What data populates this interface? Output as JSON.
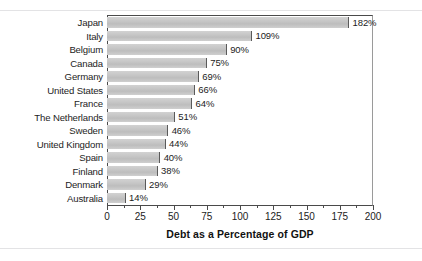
{
  "chart_data": {
    "type": "bar",
    "orientation": "horizontal",
    "title": "",
    "xlabel": "Debt as a Percentage of GDP",
    "ylabel": "",
    "xlim": [
      0,
      200
    ],
    "xticks": [
      0,
      25,
      50,
      75,
      100,
      125,
      150,
      175,
      200
    ],
    "xtick_labels": [
      "0",
      "25",
      "50",
      "75",
      "100",
      "125",
      "150",
      "175",
      "200"
    ],
    "minor_tick_step": 12.5,
    "grid": false,
    "legend": false,
    "value_label_suffix": "%",
    "bar_color": "#c6c6c6",
    "bar_end_color": "#5a5a5a",
    "categories": [
      "Japan",
      "Italy",
      "Belgium",
      "Canada",
      "Germany",
      "United States",
      "France",
      "The Netherlands",
      "Sweden",
      "United Kingdom",
      "Spain",
      "Finland",
      "Denmark",
      "Australia"
    ],
    "values": [
      182,
      109,
      90,
      75,
      69,
      66,
      64,
      51,
      46,
      44,
      40,
      38,
      29,
      14
    ],
    "value_labels": [
      "182%",
      "109%",
      "90%",
      "75%",
      "69%",
      "66%",
      "64%",
      "51%",
      "46%",
      "44%",
      "40%",
      "38%",
      "29%",
      "14%"
    ]
  }
}
